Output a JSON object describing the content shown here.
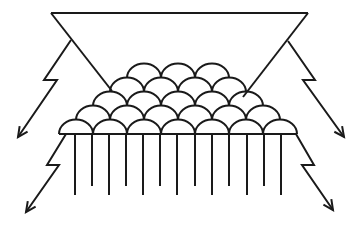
{
  "diagram": {
    "stroke_color": "#1a1a1a",
    "background": "#ffffff",
    "triangle": {
      "points": [
        [
          51,
          13
        ],
        [
          308,
          13
        ],
        [
          180,
          175
        ]
      ]
    },
    "scale_rows": [
      {
        "row": 1,
        "count": 3,
        "baseline_y": 78,
        "x_start": 127,
        "arc_width": 34
      },
      {
        "row": 2,
        "count": 4,
        "baseline_y": 92,
        "x_start": 110,
        "arc_width": 34
      },
      {
        "row": 3,
        "count": 5,
        "baseline_y": 106,
        "x_start": 93,
        "arc_width": 34
      },
      {
        "row": 4,
        "count": 6,
        "baseline_y": 120,
        "x_start": 76,
        "arc_width": 34
      },
      {
        "row": 5,
        "count": 7,
        "baseline_y": 134,
        "x_start": 59,
        "arc_width": 34
      }
    ],
    "fringe_lines": {
      "long_x": [
        75,
        109,
        143,
        177,
        212,
        247,
        281
      ],
      "short_x": [
        92,
        126,
        160,
        195,
        229,
        264
      ],
      "top_y": 134,
      "long_bottom_y": 195,
      "short_bottom_y": 186
    },
    "lightning_arrows": [
      {
        "name": "upper-left",
        "points": [
          [
            71,
            40
          ],
          [
            44,
            80
          ],
          [
            57,
            80
          ],
          [
            18,
            137
          ]
        ]
      },
      {
        "name": "lower-left",
        "points": [
          [
            66,
            134
          ],
          [
            47,
            165
          ],
          [
            59,
            165
          ],
          [
            26,
            212
          ]
        ]
      },
      {
        "name": "upper-right",
        "points": [
          [
            288,
            41
          ],
          [
            315,
            80
          ],
          [
            303,
            80
          ],
          [
            344,
            137
          ]
        ]
      },
      {
        "name": "lower-right",
        "points": [
          [
            296,
            134
          ],
          [
            314,
            165
          ],
          [
            302,
            165
          ],
          [
            333,
            210
          ]
        ]
      }
    ]
  }
}
